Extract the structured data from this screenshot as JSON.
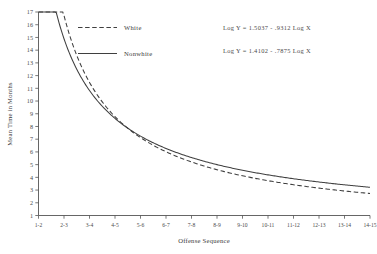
{
  "chart_data": {
    "type": "line",
    "title": "",
    "xlabel": "Offense Sequence",
    "ylabel": "Mean Time in Months",
    "categories": [
      "1-2",
      "2-3",
      "3-4",
      "4-5",
      "5-6",
      "6-7",
      "7-8",
      "8-9",
      "9-10",
      "10-11",
      "11-12",
      "12-13",
      "13-14",
      "14-15"
    ],
    "x": [
      1,
      2,
      3,
      4,
      5,
      6,
      7,
      8,
      9,
      10,
      11,
      12,
      13,
      14
    ],
    "ylim": [
      1,
      17
    ],
    "xlim": [
      1,
      14
    ],
    "yticks": [
      1,
      2,
      3,
      4,
      5,
      6,
      7,
      8,
      9,
      10,
      11,
      12,
      13,
      14,
      15,
      16,
      17
    ],
    "ytick_labels": [
      "1",
      "2",
      "3",
      "4",
      "5",
      "6",
      "7",
      "8",
      "9",
      "10",
      "11",
      "12",
      "13",
      "14",
      "15",
      "16",
      "17"
    ],
    "grid": false,
    "legend_position": "upper-center-left",
    "series": [
      {
        "name": "White",
        "style": "dashed",
        "equation": "Log Y = 1.5037 - .9312 Log X",
        "intercept": 1.5037,
        "slope": -0.9312,
        "values": [
          16.5,
          8.66,
          5.95,
          4.55,
          3.69,
          3.12,
          2.71,
          2.39,
          2.15,
          1.94,
          1.78,
          1.64,
          1.52,
          1.42
        ]
      },
      {
        "name": "Nonwhite",
        "style": "solid",
        "equation": "Log Y = 1.4102 - .7875 Log X",
        "intercept": 1.4102,
        "slope": -0.7875,
        "values": [
          15.0,
          8.68,
          6.28,
          5.02,
          4.24,
          3.7,
          3.31,
          3.0,
          2.75,
          2.55,
          2.38,
          2.23,
          2.11,
          2.0
        ]
      }
    ]
  },
  "legend": {
    "items": [
      {
        "label": "White",
        "style": "dashed"
      },
      {
        "label": "Nonwhite",
        "style": "solid"
      }
    ]
  },
  "equations": [
    {
      "text": "Log Y = 1.5037 - .9312 Log X"
    },
    {
      "text": "Log Y = 1.4102 - .7875 Log X"
    }
  ]
}
